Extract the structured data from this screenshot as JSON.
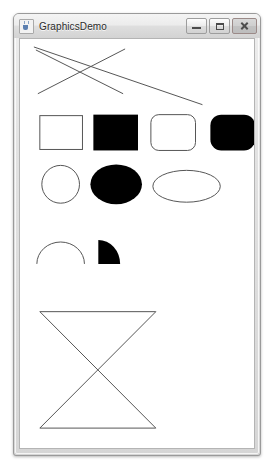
{
  "window": {
    "title": "GraphicsDemo",
    "app_icon": "java-coffee-cup-icon",
    "controls": {
      "minimize_label": "Minimize",
      "maximize_label": "Maximize",
      "close_label": "Close"
    }
  },
  "colors": {
    "stroke": "#555555",
    "fill": "#000000",
    "canvas_background": "#ffffff",
    "window_chrome": "#e2e2e2",
    "window_border": "#9a9a9a",
    "title_text": "#2b2b2b"
  },
  "canvas": {
    "name": "graphics-demo-canvas",
    "width": 236,
    "height": 411,
    "shapes": [
      {
        "id": "line-1",
        "type": "line",
        "name": "drawn-line-diagonal-down",
        "x1": 14,
        "y1": 8,
        "x2": 184,
        "y2": 66,
        "stroke": "#555555",
        "stroke_width": 1,
        "filled": false
      },
      {
        "id": "line-2",
        "type": "line",
        "name": "drawn-line-x-stroke-down",
        "x1": 16,
        "y1": 11,
        "x2": 104,
        "y2": 55,
        "stroke": "#555555",
        "stroke_width": 1,
        "filled": false
      },
      {
        "id": "line-3",
        "type": "line",
        "name": "drawn-line-x-stroke-up",
        "x1": 18,
        "y1": 55,
        "x2": 106,
        "y2": 10,
        "stroke": "#555555",
        "stroke_width": 1,
        "filled": false
      },
      {
        "id": "rect-outline",
        "type": "rect",
        "name": "draw-rect-outline",
        "x": 20,
        "y": 77,
        "width": 43,
        "height": 34,
        "rx": 0,
        "stroke": "#555555",
        "filled": false
      },
      {
        "id": "rect-filled",
        "type": "rect",
        "name": "fill-rect-solid",
        "x": 74,
        "y": 76,
        "width": 45,
        "height": 36,
        "rx": 0,
        "stroke": "none",
        "filled": true,
        "fill": "#000000"
      },
      {
        "id": "round-rect-outline",
        "type": "rect",
        "name": "draw-round-rect-outline",
        "x": 132,
        "y": 76,
        "width": 45,
        "height": 36,
        "rx": 8,
        "stroke": "#555555",
        "filled": false
      },
      {
        "id": "round-rect-filled",
        "type": "rect",
        "name": "fill-round-rect-solid",
        "x": 192,
        "y": 76,
        "width": 45,
        "height": 36,
        "rx": 11,
        "stroke": "none",
        "filled": true,
        "fill": "#000000"
      },
      {
        "id": "oval-circle-outline",
        "type": "ellipse",
        "name": "draw-oval-circle-outline",
        "cx": 41,
        "cy": 146,
        "rx": 19,
        "ry": 19,
        "stroke": "#555555",
        "filled": false
      },
      {
        "id": "oval-filled",
        "type": "ellipse",
        "name": "fill-oval-solid",
        "cx": 97,
        "cy": 146,
        "rx": 26,
        "ry": 20,
        "stroke": "none",
        "filled": true,
        "fill": "#000000"
      },
      {
        "id": "oval-wide-outline",
        "type": "ellipse",
        "name": "draw-oval-wide-outline",
        "cx": 168,
        "cy": 148,
        "rx": 34,
        "ry": 16,
        "stroke": "#555555",
        "filled": false
      },
      {
        "id": "arc-outline",
        "type": "arc",
        "name": "draw-arc-half-dome-outline",
        "cx": 41,
        "cy": 226,
        "rx": 24,
        "ry": 22,
        "start_angle": 0,
        "arc_extent": 180,
        "stroke": "#555555",
        "filled": false
      },
      {
        "id": "arc-filled",
        "type": "arc",
        "name": "fill-arc-pie-wedge",
        "cx": 79,
        "cy": 226,
        "rx": 22,
        "ry": 24,
        "start_angle": 0,
        "arc_extent": 90,
        "stroke": "none",
        "filled": true,
        "fill": "#000000"
      },
      {
        "id": "polygon-bowtie",
        "type": "polygon",
        "name": "draw-polygon-bowtie",
        "points": "20,274 137,274 20,391 137,391 20,274",
        "stroke": "#555555",
        "filled": false
      }
    ]
  }
}
